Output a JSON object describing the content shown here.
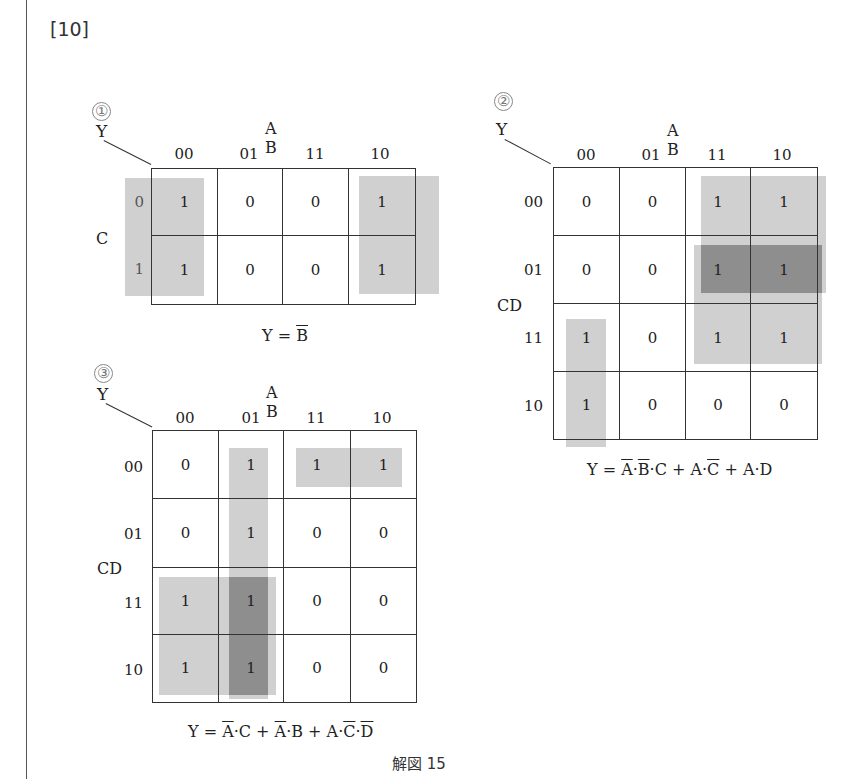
{
  "section_label": "[10]",
  "caption": "解図 15",
  "maps": [
    {
      "id": "1",
      "number_mark": "①",
      "output_label": "Y",
      "col_var": "A B",
      "row_var": "C",
      "col_headers": [
        "00",
        "01",
        "11",
        "10"
      ],
      "row_headers": [
        "0",
        "1"
      ],
      "cells": [
        [
          "1",
          "0",
          "0",
          "1"
        ],
        [
          "1",
          "0",
          "0",
          "1"
        ]
      ],
      "formula_parts": [
        {
          "t": "Y = "
        },
        {
          "t": "B",
          "bar": true
        }
      ]
    },
    {
      "id": "2",
      "number_mark": "②",
      "output_label": "Y",
      "col_var": "A B",
      "row_var": "CD",
      "col_headers": [
        "00",
        "01",
        "11",
        "10"
      ],
      "row_headers": [
        "00",
        "01",
        "11",
        "10"
      ],
      "cells": [
        [
          "0",
          "0",
          "1",
          "1"
        ],
        [
          "0",
          "0",
          "1",
          "1"
        ],
        [
          "1",
          "0",
          "1",
          "1"
        ],
        [
          "1",
          "0",
          "0",
          "0"
        ]
      ],
      "formula_parts": [
        {
          "t": "Y = "
        },
        {
          "t": "A",
          "bar": true
        },
        {
          "t": "·"
        },
        {
          "t": "B",
          "bar": true
        },
        {
          "t": "·C + A·"
        },
        {
          "t": "C",
          "bar": true
        },
        {
          "t": " + A·D"
        }
      ]
    },
    {
      "id": "3",
      "number_mark": "③",
      "output_label": "Y",
      "col_var": "A B",
      "row_var": "CD",
      "col_headers": [
        "00",
        "01",
        "11",
        "10"
      ],
      "row_headers": [
        "00",
        "01",
        "11",
        "10"
      ],
      "cells": [
        [
          "0",
          "1",
          "1",
          "1"
        ],
        [
          "0",
          "1",
          "0",
          "0"
        ],
        [
          "1",
          "1",
          "0",
          "0"
        ],
        [
          "1",
          "1",
          "0",
          "0"
        ]
      ],
      "formula_parts": [
        {
          "t": "Y = "
        },
        {
          "t": "A",
          "bar": true
        },
        {
          "t": "·C + "
        },
        {
          "t": "A",
          "bar": true
        },
        {
          "t": "·B + A·"
        },
        {
          "t": "C",
          "bar": true
        },
        {
          "t": "·"
        },
        {
          "t": "D",
          "bar": true
        }
      ]
    }
  ],
  "colors": {
    "grid_line": "#333333",
    "shade": "#a0a0a0",
    "shade_dark": "#7a7a7a"
  }
}
